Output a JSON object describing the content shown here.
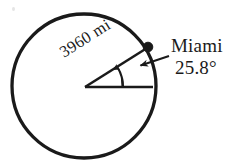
{
  "figure": {
    "type": "geometry-diagram",
    "background_color": "#ffffff",
    "ink_color": "#1a1a1a",
    "labels": {
      "radius_label": "3960 mi",
      "point_label": "Miami",
      "angle_label": "25.8°"
    },
    "circle": {
      "center_x": 84,
      "center_y": 86,
      "radius": 72,
      "stroke_width": 3.2,
      "filled": false
    },
    "center_vertex": {
      "x": 85,
      "y": 87
    },
    "point_on_circle": {
      "name": "Miami",
      "x": 148,
      "y": 47,
      "marker": "filled-dot",
      "marker_radius": 4.6
    },
    "radius_line": {
      "from_x": 85,
      "from_y": 87,
      "to_x": 148,
      "to_y": 47,
      "angle_degrees": 32.4,
      "stroke_width": 2.4
    },
    "horizontal_line": {
      "from_x": 85,
      "from_y": 87,
      "to_x": 153,
      "to_y": 87,
      "stroke_width": 2.4
    },
    "angle_arc": {
      "center_x": 85,
      "center_y": 87,
      "radius": 38,
      "start_degrees": 0,
      "end_degrees": 32.4,
      "arrow_at": "end",
      "stroke_width": 2.0
    },
    "leader_line": {
      "from_x": 168,
      "from_y": 57,
      "to_x": 140,
      "to_y": 66,
      "arrow_at": "to",
      "stroke_width": 2.0
    },
    "vertical_tick": {
      "x": 122,
      "from_y": 87,
      "to_y": 62,
      "stroke_width": 2.0
    }
  }
}
